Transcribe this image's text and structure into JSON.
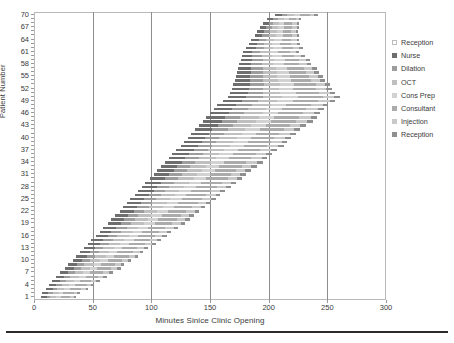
{
  "chart_data": {
    "type": "bar",
    "subtype": "stacked-horizontal-gantt",
    "title": "",
    "xlabel": "Minutes Sinice Clinic Opening",
    "ylabel": "Patient Number",
    "xlim": [
      0,
      300
    ],
    "ylim": [
      1,
      70
    ],
    "xticks": [
      0,
      50,
      100,
      150,
      200,
      250,
      300
    ],
    "yticks": [
      1,
      4,
      7,
      10,
      13,
      16,
      19,
      22,
      25,
      28,
      31,
      34,
      37,
      40,
      43,
      46,
      49,
      52,
      55,
      58,
      61,
      64,
      67,
      70
    ],
    "gridlines_x": [
      50,
      100,
      150,
      200,
      250
    ],
    "grid": true,
    "legend_position": "right",
    "legend": [
      {
        "name": "Reception",
        "color": "#ffffff"
      },
      {
        "name": "Nurse",
        "color": "#6e6e6e"
      },
      {
        "name": "Dilation",
        "color": "#9d9d9d"
      },
      {
        "name": "OCT",
        "color": "#bfbfbf"
      },
      {
        "name": "Cons Prep",
        "color": "#d2d2d2"
      },
      {
        "name": "Consultant",
        "color": "#ababab"
      },
      {
        "name": "Injection",
        "color": "#c9c9c9"
      },
      {
        "name": "Reception",
        "color": "#8f8f8f"
      }
    ],
    "series": [
      {
        "name": "Reception",
        "color": "#ffffff"
      },
      {
        "name": "Nurse",
        "color": "#6e6e6e"
      },
      {
        "name": "Dilation",
        "color": "#9d9d9d"
      },
      {
        "name": "OCT",
        "color": "#bfbfbf"
      },
      {
        "name": "Cons Prep",
        "color": "#d2d2d2"
      },
      {
        "name": "Consultant",
        "color": "#ababab"
      },
      {
        "name": "Injection",
        "color": "#c9c9c9"
      },
      {
        "name": "Reception",
        "color": "#8f8f8f"
      }
    ],
    "categories": [
      1,
      2,
      3,
      4,
      5,
      6,
      7,
      8,
      9,
      10,
      11,
      12,
      13,
      14,
      15,
      16,
      17,
      18,
      19,
      20,
      21,
      22,
      23,
      24,
      25,
      26,
      27,
      28,
      29,
      30,
      31,
      32,
      33,
      34,
      35,
      36,
      37,
      38,
      39,
      40,
      41,
      42,
      43,
      44,
      45,
      46,
      47,
      48,
      49,
      50,
      51,
      52,
      53,
      54,
      55,
      56,
      57,
      58,
      59,
      60,
      61,
      62,
      63,
      64,
      65,
      66,
      67,
      68,
      69,
      70
    ],
    "rows": [
      {
        "patient": 1,
        "start": 0,
        "segments": [
          6,
          5,
          3,
          5,
          4,
          8,
          3,
          2
        ]
      },
      {
        "patient": 2,
        "start": 0,
        "segments": [
          7,
          5,
          4,
          5,
          4,
          9,
          3,
          2
        ]
      },
      {
        "patient": 3,
        "start": 2,
        "segments": [
          8,
          6,
          4,
          6,
          5,
          9,
          4,
          2
        ]
      },
      {
        "patient": 4,
        "start": 4,
        "segments": [
          9,
          6,
          5,
          6,
          5,
          10,
          4,
          2
        ]
      },
      {
        "patient": 5,
        "start": 6,
        "segments": [
          9,
          7,
          5,
          7,
          5,
          10,
          4,
          3
        ]
      },
      {
        "patient": 6,
        "start": 9,
        "segments": [
          10,
          7,
          5,
          7,
          6,
          11,
          4,
          3
        ]
      },
      {
        "patient": 7,
        "start": 12,
        "segments": [
          10,
          7,
          6,
          7,
          6,
          11,
          5,
          3
        ]
      },
      {
        "patient": 8,
        "start": 15,
        "segments": [
          11,
          8,
          6,
          8,
          6,
          12,
          5,
          3
        ]
      },
      {
        "patient": 9,
        "start": 18,
        "segments": [
          11,
          8,
          6,
          8,
          6,
          12,
          5,
          3
        ]
      },
      {
        "patient": 10,
        "start": 21,
        "segments": [
          12,
          8,
          7,
          8,
          7,
          12,
          5,
          3
        ]
      },
      {
        "patient": 11,
        "start": 24,
        "segments": [
          12,
          9,
          7,
          9,
          7,
          13,
          5,
          3
        ]
      },
      {
        "patient": 12,
        "start": 27,
        "segments": [
          12,
          9,
          7,
          9,
          7,
          13,
          6,
          3
        ]
      },
      {
        "patient": 13,
        "start": 30,
        "segments": [
          13,
          9,
          7,
          9,
          7,
          13,
          6,
          3
        ]
      },
      {
        "patient": 14,
        "start": 33,
        "segments": [
          13,
          10,
          8,
          9,
          8,
          14,
          6,
          3
        ]
      },
      {
        "patient": 15,
        "start": 36,
        "segments": [
          13,
          10,
          8,
          10,
          8,
          14,
          6,
          3
        ]
      },
      {
        "patient": 16,
        "start": 39,
        "segments": [
          14,
          10,
          8,
          10,
          8,
          14,
          6,
          4
        ]
      },
      {
        "patient": 17,
        "start": 42,
        "segments": [
          14,
          10,
          8,
          10,
          8,
          15,
          6,
          4
        ]
      },
      {
        "patient": 18,
        "start": 45,
        "segments": [
          14,
          11,
          9,
          10,
          8,
          15,
          7,
          4
        ]
      },
      {
        "patient": 19,
        "start": 48,
        "segments": [
          15,
          11,
          9,
          11,
          9,
          15,
          7,
          4
        ]
      },
      {
        "patient": 20,
        "start": 51,
        "segments": [
          15,
          11,
          9,
          11,
          9,
          16,
          7,
          4
        ]
      },
      {
        "patient": 21,
        "start": 54,
        "segments": [
          15,
          11,
          9,
          11,
          9,
          16,
          7,
          4
        ]
      },
      {
        "patient": 22,
        "start": 57,
        "segments": [
          16,
          12,
          9,
          11,
          9,
          16,
          7,
          4
        ]
      },
      {
        "patient": 23,
        "start": 60,
        "segments": [
          16,
          12,
          10,
          12,
          9,
          16,
          7,
          4
        ]
      },
      {
        "patient": 24,
        "start": 63,
        "segments": [
          16,
          12,
          10,
          12,
          10,
          17,
          7,
          4
        ]
      },
      {
        "patient": 25,
        "start": 66,
        "segments": [
          16,
          12,
          10,
          12,
          10,
          17,
          8,
          4
        ]
      },
      {
        "patient": 26,
        "start": 69,
        "segments": [
          17,
          12,
          10,
          12,
          10,
          17,
          8,
          4
        ]
      },
      {
        "patient": 27,
        "start": 72,
        "segments": [
          17,
          13,
          10,
          12,
          10,
          17,
          8,
          4
        ]
      },
      {
        "patient": 28,
        "start": 75,
        "segments": [
          17,
          13,
          10,
          13,
          10,
          18,
          8,
          4
        ]
      },
      {
        "patient": 29,
        "start": 78,
        "segments": [
          17,
          13,
          11,
          13,
          10,
          18,
          8,
          4
        ]
      },
      {
        "patient": 30,
        "start": 81,
        "segments": [
          18,
          13,
          11,
          13,
          11,
          18,
          8,
          4
        ]
      },
      {
        "patient": 31,
        "start": 84,
        "segments": [
          18,
          13,
          11,
          13,
          11,
          18,
          8,
          5
        ]
      },
      {
        "patient": 32,
        "start": 87,
        "segments": [
          18,
          14,
          11,
          13,
          11,
          18,
          8,
          5
        ]
      },
      {
        "patient": 33,
        "start": 90,
        "segments": [
          18,
          14,
          11,
          14,
          11,
          19,
          8,
          5
        ]
      },
      {
        "patient": 34,
        "start": 93,
        "segments": [
          19,
          14,
          11,
          14,
          11,
          19,
          9,
          5
        ]
      },
      {
        "patient": 35,
        "start": 96,
        "segments": [
          19,
          14,
          12,
          14,
          11,
          19,
          9,
          5
        ]
      },
      {
        "patient": 36,
        "start": 99,
        "segments": [
          19,
          14,
          12,
          14,
          12,
          19,
          9,
          5
        ]
      },
      {
        "patient": 37,
        "start": 102,
        "segments": [
          19,
          15,
          12,
          14,
          12,
          19,
          9,
          5
        ]
      },
      {
        "patient": 38,
        "start": 105,
        "segments": [
          20,
          15,
          12,
          15,
          12,
          20,
          9,
          5
        ]
      },
      {
        "patient": 39,
        "start": 108,
        "segments": [
          20,
          15,
          12,
          15,
          12,
          20,
          9,
          5
        ]
      },
      {
        "patient": 40,
        "start": 111,
        "segments": [
          20,
          15,
          12,
          15,
          12,
          20,
          9,
          5
        ]
      },
      {
        "patient": 41,
        "start": 114,
        "segments": [
          20,
          15,
          13,
          15,
          12,
          20,
          9,
          5
        ]
      },
      {
        "patient": 42,
        "start": 117,
        "segments": [
          20,
          15,
          13,
          15,
          13,
          20,
          9,
          5
        ]
      },
      {
        "patient": 43,
        "start": 120,
        "segments": [
          21,
          16,
          13,
          15,
          13,
          20,
          9,
          5
        ]
      },
      {
        "patient": 44,
        "start": 123,
        "segments": [
          21,
          16,
          13,
          16,
          13,
          21,
          10,
          5
        ]
      },
      {
        "patient": 45,
        "start": 126,
        "segments": [
          21,
          16,
          13,
          16,
          13,
          21,
          10,
          5
        ]
      },
      {
        "patient": 46,
        "start": 129,
        "segments": [
          21,
          16,
          13,
          16,
          13,
          21,
          10,
          5
        ]
      },
      {
        "patient": 47,
        "start": 132,
        "segments": [
          21,
          16,
          13,
          16,
          13,
          21,
          10,
          5
        ]
      },
      {
        "patient": 48,
        "start": 135,
        "segments": [
          21,
          16,
          14,
          16,
          13,
          21,
          10,
          5
        ]
      },
      {
        "patient": 49,
        "start": 139,
        "segments": [
          22,
          16,
          14,
          16,
          14,
          21,
          10,
          5
        ]
      },
      {
        "patient": 50,
        "start": 143,
        "segments": [
          22,
          16,
          14,
          16,
          14,
          21,
          10,
          5
        ]
      },
      {
        "patient": 51,
        "start": 147,
        "segments": [
          20,
          15,
          13,
          15,
          13,
          20,
          9,
          5
        ]
      },
      {
        "patient": 52,
        "start": 150,
        "segments": [
          19,
          14,
          12,
          14,
          12,
          19,
          9,
          5
        ]
      },
      {
        "patient": 53,
        "start": 152,
        "segments": [
          18,
          14,
          12,
          14,
          12,
          18,
          8,
          4
        ]
      },
      {
        "patient": 54,
        "start": 154,
        "segments": [
          17,
          13,
          11,
          13,
          11,
          17,
          8,
          4
        ]
      },
      {
        "patient": 55,
        "start": 156,
        "segments": [
          16,
          12,
          11,
          12,
          11,
          16,
          8,
          4
        ]
      },
      {
        "patient": 56,
        "start": 158,
        "segments": [
          15,
          12,
          10,
          12,
          10,
          15,
          7,
          4
        ]
      },
      {
        "patient": 57,
        "start": 160,
        "segments": [
          14,
          11,
          10,
          11,
          10,
          14,
          7,
          4
        ]
      },
      {
        "patient": 58,
        "start": 162,
        "segments": [
          13,
          10,
          9,
          10,
          9,
          13,
          7,
          3
        ]
      },
      {
        "patient": 59,
        "start": 164,
        "segments": [
          12,
          10,
          9,
          10,
          9,
          12,
          6,
          3
        ]
      },
      {
        "patient": 60,
        "start": 166,
        "segments": [
          11,
          9,
          8,
          9,
          8,
          11,
          6,
          3
        ]
      },
      {
        "patient": 61,
        "start": 168,
        "segments": [
          10,
          8,
          7,
          8,
          7,
          10,
          5,
          3
        ]
      },
      {
        "patient": 62,
        "start": 171,
        "segments": [
          10,
          8,
          7,
          8,
          7,
          10,
          5,
          3
        ]
      },
      {
        "patient": 63,
        "start": 174,
        "segments": [
          9,
          7,
          6,
          7,
          7,
          9,
          5,
          3
        ]
      },
      {
        "patient": 64,
        "start": 177,
        "segments": [
          8,
          7,
          6,
          7,
          6,
          8,
          5,
          2
        ]
      },
      {
        "patient": 65,
        "start": 180,
        "segments": [
          8,
          6,
          6,
          6,
          6,
          8,
          4,
          2
        ]
      },
      {
        "patient": 66,
        "start": 183,
        "segments": [
          7,
          6,
          5,
          6,
          5,
          7,
          4,
          2
        ]
      },
      {
        "patient": 67,
        "start": 186,
        "segments": [
          7,
          5,
          5,
          5,
          5,
          7,
          4,
          2
        ]
      },
      {
        "patient": 68,
        "start": 189,
        "segments": [
          6,
          5,
          4,
          5,
          4,
          7,
          4,
          2
        ]
      },
      {
        "patient": 69,
        "start": 193,
        "segments": [
          6,
          5,
          4,
          5,
          4,
          6,
          3,
          2
        ]
      },
      {
        "patient": 70,
        "start": 198,
        "segments": [
          7,
          6,
          5,
          6,
          5,
          8,
          4,
          3
        ]
      }
    ]
  }
}
